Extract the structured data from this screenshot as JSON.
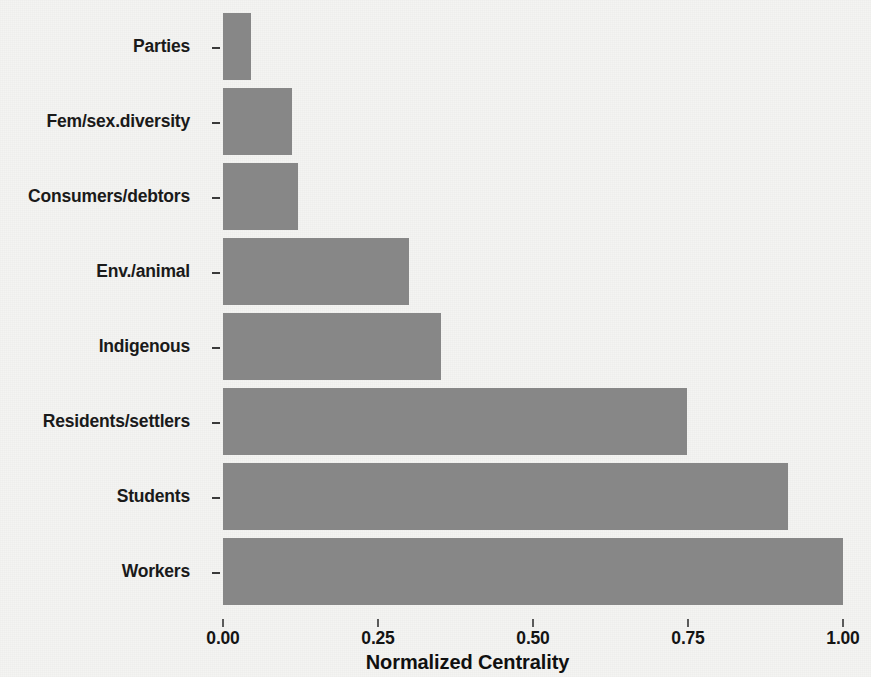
{
  "chart_data": {
    "type": "bar",
    "orientation": "horizontal",
    "title": "",
    "xlabel": "Normalized Centrality",
    "ylabel": "",
    "xlim": [
      0,
      1.0
    ],
    "grid": false,
    "legend": null,
    "bar_color": "#878787",
    "background_color": "#f4f4f2",
    "x_ticks": [
      "0.00",
      "0.25",
      "0.50",
      "0.75",
      "1.00"
    ],
    "x_tick_values": [
      0.0,
      0.25,
      0.5,
      0.75,
      1.0
    ],
    "categories": [
      "Parties",
      "Fem/sex.diversity",
      "Consumers/debtors",
      "Env./animal",
      "Indigenous",
      "Residents/settlers",
      "Students",
      "Workers"
    ],
    "values": [
      0.045,
      0.111,
      0.121,
      0.3,
      0.352,
      0.748,
      0.911,
      1.0
    ]
  },
  "axis": {
    "x_title": "Normalized Centrality"
  }
}
